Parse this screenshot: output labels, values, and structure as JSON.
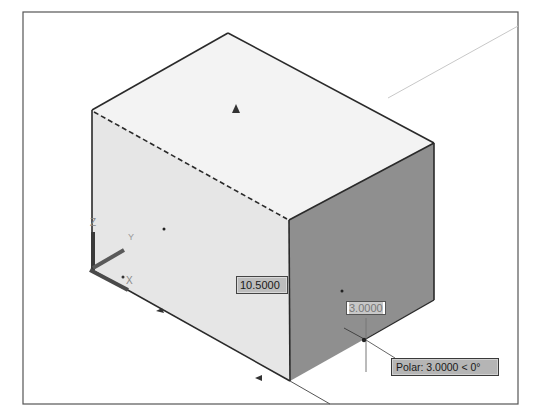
{
  "viewport": {
    "background": "#ffffff",
    "frame_color": "#555555",
    "faces": {
      "top_color": "#f2f2f2",
      "left_color": "#e4e4e4",
      "right_color": "#8e8e8e"
    }
  },
  "dimensions": {
    "length_value": "10.5000",
    "input_value": "3.0000"
  },
  "tooltip": {
    "polar_text": "Polar: 3.0000 < 0°"
  },
  "ucs": {
    "z_label": "Z",
    "y_label": "Y",
    "x_label": "X"
  },
  "icons": {
    "grip": "triangle-grip-icon",
    "crosshair": "crosshair-cursor-icon",
    "ucs": "ucs-axes-icon"
  }
}
